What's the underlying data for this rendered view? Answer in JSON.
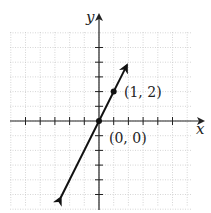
{
  "figure": {
    "x_axis_label": "x",
    "y_axis_label": "y",
    "points": [
      {
        "label": "(1, 2)",
        "x": 1,
        "y": 2
      },
      {
        "label": "(0, 0)",
        "x": 0,
        "y": 0
      }
    ],
    "line": {
      "equation": "y = 2x",
      "slope": 2,
      "intercept": 0
    },
    "grid": {
      "xmin": -6,
      "xmax": 6,
      "ymin": -6,
      "ymax": 6,
      "step": 1
    },
    "colors": {
      "line": "#111111",
      "grid": "#bbbbbb",
      "axis": "#222222"
    }
  },
  "chart_data": {
    "type": "line",
    "title": "",
    "xlabel": "x",
    "ylabel": "y",
    "series": [
      {
        "name": "y = 2x",
        "x": [
          -2.6,
          0,
          1,
          1.9
        ],
        "y": [
          -5.2,
          0,
          2,
          3.8
        ]
      }
    ],
    "annotations": [
      "(1, 2)",
      "(0, 0)"
    ],
    "xlim": [
      -6,
      6
    ],
    "ylim": [
      -6,
      6
    ],
    "grid": true
  }
}
